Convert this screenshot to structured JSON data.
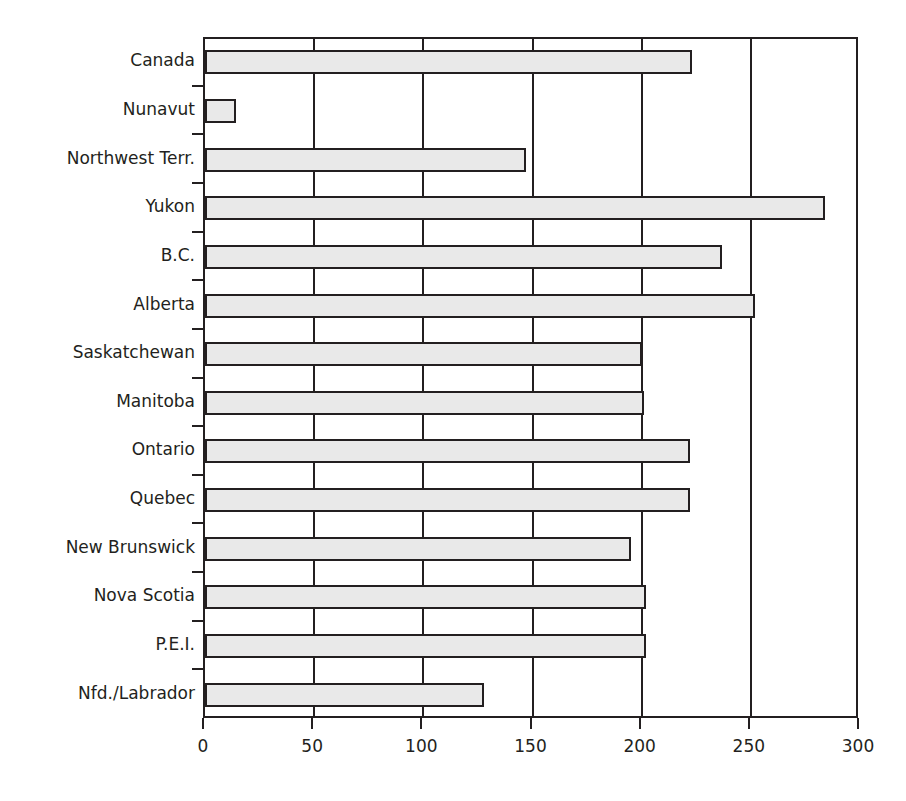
{
  "chart_data": {
    "type": "bar",
    "orientation": "horizontal",
    "title": "",
    "xlabel": "",
    "ylabel": "",
    "xlim": [
      0,
      300
    ],
    "xticks": [
      0,
      50,
      100,
      150,
      200,
      250,
      300
    ],
    "xtick_labels": [
      "0",
      "50",
      "100",
      "150",
      "200",
      "250",
      "300"
    ],
    "grid": true,
    "grid_axis": "x",
    "legend": false,
    "categories": [
      "Canada",
      "Nunavut",
      "Northwest Terr.",
      "Yukon",
      "B.C.",
      "Alberta",
      "Saskatchewan",
      "Manitoba",
      "Ontario",
      "Quebec",
      "New Brunswick",
      "Nova Scotia",
      "P.E.I.",
      "Nfd./Labrador"
    ],
    "values": [
      223,
      14,
      147,
      284,
      237,
      252,
      200,
      201,
      222,
      222,
      195,
      202,
      202,
      128
    ],
    "series": [
      {
        "name": "",
        "values": [
          223,
          14,
          147,
          284,
          237,
          252,
          200,
          201,
          222,
          222,
          195,
          202,
          202,
          128
        ]
      }
    ],
    "colors": {
      "bar_fill": "#e9e9e9",
      "bar_edge": "#231f20",
      "axis": "#231f20",
      "grid": "#231f20",
      "background": "#ffffff",
      "text": "#231f20"
    }
  }
}
